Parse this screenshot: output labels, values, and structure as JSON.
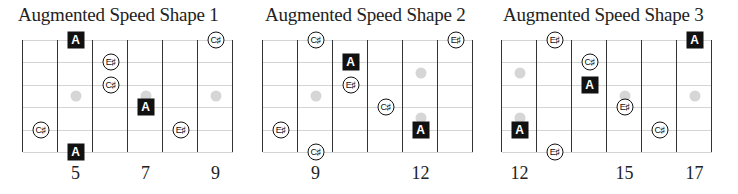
{
  "layout": {
    "string_y": [
      0,
      22.4,
      44.8,
      67.2,
      89.6,
      112
    ],
    "fret_width": 35,
    "num_columns": 6
  },
  "colors": {
    "fret_line": "#333333",
    "string_line": "#d4d4d4",
    "inlay_dot": "#d6d6d6",
    "root_fill": "#111111",
    "note_outline": "#111111"
  },
  "diagrams": [
    {
      "title": "Augmented Speed Shape 1",
      "left": 23,
      "title_left": 18,
      "fret_numbers": [
        {
          "label": "5",
          "col": 1
        },
        {
          "label": "7",
          "col": 3
        },
        {
          "label": "9",
          "col": 5
        }
      ],
      "inlays": [
        {
          "col": 1,
          "y": 56
        },
        {
          "col": 3,
          "y": 56
        },
        {
          "col": 5,
          "y": 56
        }
      ],
      "notes": [
        {
          "type": "root",
          "label": "A",
          "col": 1,
          "string": 0
        },
        {
          "type": "note",
          "label": "C♯",
          "col": 5,
          "string": 0
        },
        {
          "type": "note",
          "label": "E♯",
          "col": 2,
          "string": 1
        },
        {
          "type": "note",
          "label": "C♯",
          "col": 2,
          "string": 2
        },
        {
          "type": "root",
          "label": "A",
          "col": 3,
          "string": 3
        },
        {
          "type": "note",
          "label": "C♯",
          "col": 0,
          "string": 4
        },
        {
          "type": "note",
          "label": "E♯",
          "col": 4,
          "string": 4
        },
        {
          "type": "root",
          "label": "A",
          "col": 1,
          "string": 5
        }
      ]
    },
    {
      "title": "Augmented Speed Shape 2",
      "left": 263,
      "title_left": 265,
      "fret_numbers": [
        {
          "label": "9",
          "col": 1
        },
        {
          "label": "12",
          "col": 4
        }
      ],
      "inlays": [
        {
          "col": 1,
          "y": 56
        },
        {
          "col": 4,
          "y": 33
        },
        {
          "col": 4,
          "y": 78
        }
      ],
      "notes": [
        {
          "type": "note",
          "label": "C♯",
          "col": 1,
          "string": 0
        },
        {
          "type": "note",
          "label": "E♯",
          "col": 5,
          "string": 0
        },
        {
          "type": "root",
          "label": "A",
          "col": 2,
          "string": 1
        },
        {
          "type": "note",
          "label": "E♯",
          "col": 2,
          "string": 2
        },
        {
          "type": "note",
          "label": "C♯",
          "col": 3,
          "string": 3
        },
        {
          "type": "note",
          "label": "E♯",
          "col": 0,
          "string": 4
        },
        {
          "type": "root",
          "label": "A",
          "col": 4,
          "string": 4
        },
        {
          "type": "note",
          "label": "C♯",
          "col": 1,
          "string": 5
        }
      ]
    },
    {
      "title": "Augmented Speed Shape 3",
      "left": 502,
      "title_left": 503,
      "fret_numbers": [
        {
          "label": "12",
          "col": 0
        },
        {
          "label": "15",
          "col": 3
        },
        {
          "label": "17",
          "col": 5
        }
      ],
      "inlays": [
        {
          "col": 0,
          "y": 33
        },
        {
          "col": 0,
          "y": 78
        },
        {
          "col": 3,
          "y": 56
        },
        {
          "col": 5,
          "y": 56
        }
      ],
      "notes": [
        {
          "type": "note",
          "label": "E♯",
          "col": 1,
          "string": 0
        },
        {
          "type": "root",
          "label": "A",
          "col": 5,
          "string": 0
        },
        {
          "type": "note",
          "label": "C♯",
          "col": 2,
          "string": 1
        },
        {
          "type": "root",
          "label": "A",
          "col": 2,
          "string": 2
        },
        {
          "type": "note",
          "label": "E♯",
          "col": 3,
          "string": 3
        },
        {
          "type": "root",
          "label": "A",
          "col": 0,
          "string": 4
        },
        {
          "type": "note",
          "label": "C♯",
          "col": 4,
          "string": 4
        },
        {
          "type": "note",
          "label": "E♯",
          "col": 1,
          "string": 5
        }
      ]
    }
  ]
}
